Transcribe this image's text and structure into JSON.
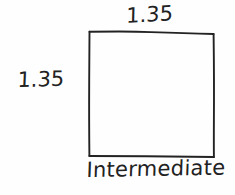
{
  "image": {
    "kind": "handwritten-geometry-sketch",
    "background_color": "#fefefe",
    "ink_color": "#222222"
  },
  "figure": {
    "shape_name": "square",
    "stroke_color": "#232323"
  },
  "labels": {
    "top_side": "1.35",
    "left_side": "1.35",
    "caption": "Intermediate"
  }
}
